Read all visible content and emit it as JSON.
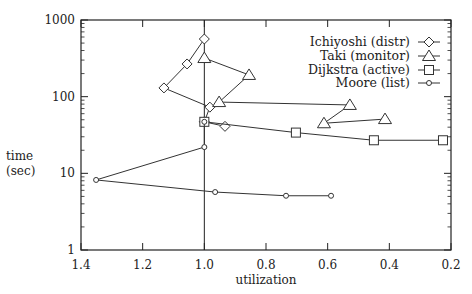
{
  "chart_data": {
    "type": "line",
    "title": "",
    "xlabel": "utilization",
    "ylabel": "time\n(sec)",
    "xlim": [
      1.4,
      0.2
    ],
    "x_reversed": true,
    "ylim": [
      1,
      1000
    ],
    "y_scale": "log",
    "x_ticks": [
      1.4,
      1.2,
      1.0,
      0.8,
      0.6,
      0.4,
      0.2
    ],
    "x_tick_labels": [
      "1.4",
      "1.2",
      "1.0",
      "0.8",
      "0.6",
      "0.4",
      "0.2"
    ],
    "y_ticks": [
      1,
      10,
      100,
      1000
    ],
    "y_tick_labels": [
      "1",
      "10",
      "100",
      "1000"
    ],
    "grid": false,
    "reference_line": {
      "x": 1.0,
      "orientation": "vertical"
    },
    "legend_position": "upper right",
    "series": [
      {
        "name": "Ichiyoshi (distr)",
        "marker": "diamond",
        "points": [
          [
            1.0,
            565
          ],
          [
            1.056,
            267
          ],
          [
            1.131,
            130
          ],
          [
            0.982,
            73
          ],
          [
            1.0,
            47
          ],
          [
            0.933,
            41
          ]
        ]
      },
      {
        "name": "Taki (monitor)",
        "marker": "triangle",
        "points": [
          [
            1.0,
            319
          ],
          [
            0.855,
            192
          ],
          [
            0.952,
            85
          ],
          [
            0.528,
            78
          ],
          [
            0.612,
            45
          ],
          [
            0.414,
            51
          ]
        ]
      },
      {
        "name": "Dijkstra (active)",
        "marker": "square",
        "points": [
          [
            1.0,
            47
          ],
          [
            0.703,
            34
          ],
          [
            0.45,
            27
          ],
          [
            0.226,
            27
          ]
        ]
      },
      {
        "name": "Moore (list)",
        "marker": "circle",
        "points": [
          [
            1.0,
            47
          ],
          [
            1.0,
            22
          ],
          [
            1.351,
            8.2
          ],
          [
            0.965,
            5.7
          ],
          [
            0.735,
            5.1
          ],
          [
            0.589,
            5.1
          ]
        ]
      }
    ]
  },
  "colors": {
    "line": "#333333",
    "axis": "#222222",
    "background": "#ffffff"
  }
}
